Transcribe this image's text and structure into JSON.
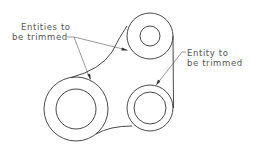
{
  "diagram": {
    "type": "cad-trim-illustration",
    "colors": {
      "stroke": "#333333",
      "text": "#555555",
      "background": "#ffffff"
    },
    "labels": {
      "left": {
        "line1": "Entities to",
        "line2": "be trimmed"
      },
      "right": {
        "line1": "Entity to",
        "line2": "be trimmed"
      }
    },
    "circles": [
      {
        "name": "top",
        "cx": 150,
        "cy": 36,
        "outer_r": 23,
        "inner_r": 10
      },
      {
        "name": "bottom-left",
        "cx": 76,
        "cy": 109,
        "outer_r": 32,
        "inner_r": 20
      },
      {
        "name": "bottom-right",
        "cx": 150,
        "cy": 108,
        "outer_r": 23,
        "inner_r": 16
      }
    ]
  }
}
